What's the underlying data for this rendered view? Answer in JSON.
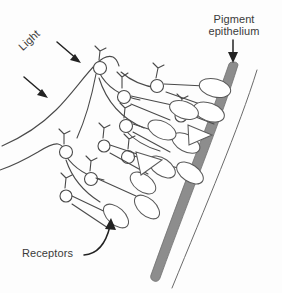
{
  "figure": {
    "title_alt": "Cross-section diagram of the retina",
    "background_color": "#fdfdfd",
    "ink_color": "#4a4a4a",
    "band_color": "#8d8d8d",
    "arrow_color": "#222222"
  },
  "labels": {
    "light": "Light",
    "pigment_epithelium": "Pigment\nepithelium",
    "pigment_epithelium_line1": "Pigment",
    "pigment_epithelium_line2": "epithelium",
    "receptors": "Receptors"
  },
  "annotations": [
    {
      "name": "light-arrow-upper",
      "label": "Light",
      "kind": "straight-arrow",
      "direction": "down-right",
      "from": [
        57,
        42
      ],
      "to": [
        80,
        62
      ]
    },
    {
      "name": "light-arrow-lower",
      "label": "Light",
      "kind": "straight-arrow",
      "direction": "down-right",
      "from": [
        24,
        77
      ],
      "to": [
        48,
        97
      ]
    },
    {
      "name": "pigment-epithelium-arrow",
      "label": "Pigment epithelium",
      "kind": "straight-arrow",
      "direction": "down",
      "from": [
        233,
        40
      ],
      "to": [
        233,
        63
      ]
    },
    {
      "name": "receptors-arrow",
      "label": "Receptors",
      "kind": "curved-arrow",
      "direction": "up-right",
      "from": [
        84,
        255
      ],
      "to": [
        110,
        219
      ]
    }
  ],
  "structures": {
    "pigment_epithelium_band": "thick gray arc along the outer retina",
    "outer_boundary_arc": "thin line outside the pigment epithelium",
    "inner_retinal_surface": "curved line at the inner (light-facing) surface",
    "cell_bodies": 12,
    "rod_outer_segments": 10,
    "cone_outer_segments": 2,
    "dendrite_branches": 10
  }
}
